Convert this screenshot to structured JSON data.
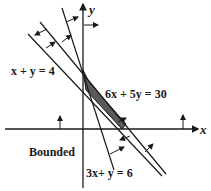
{
  "diagram": {
    "axes": {
      "x_label": "x",
      "y_label": "y"
    },
    "lines": [
      {
        "id": "x_plus_y_eq_4",
        "label": "x + y = 4"
      },
      {
        "id": "6x_plus_5y_eq_30",
        "label": "6x + 5y = 30"
      },
      {
        "id": "3x_plus_y_eq_6",
        "label": "3x+ y = 6"
      }
    ],
    "region_label": "Bounded",
    "colors": {
      "ink": "#1a1a1a",
      "shade": "#5a5a5a",
      "background": "#ffffff"
    }
  }
}
